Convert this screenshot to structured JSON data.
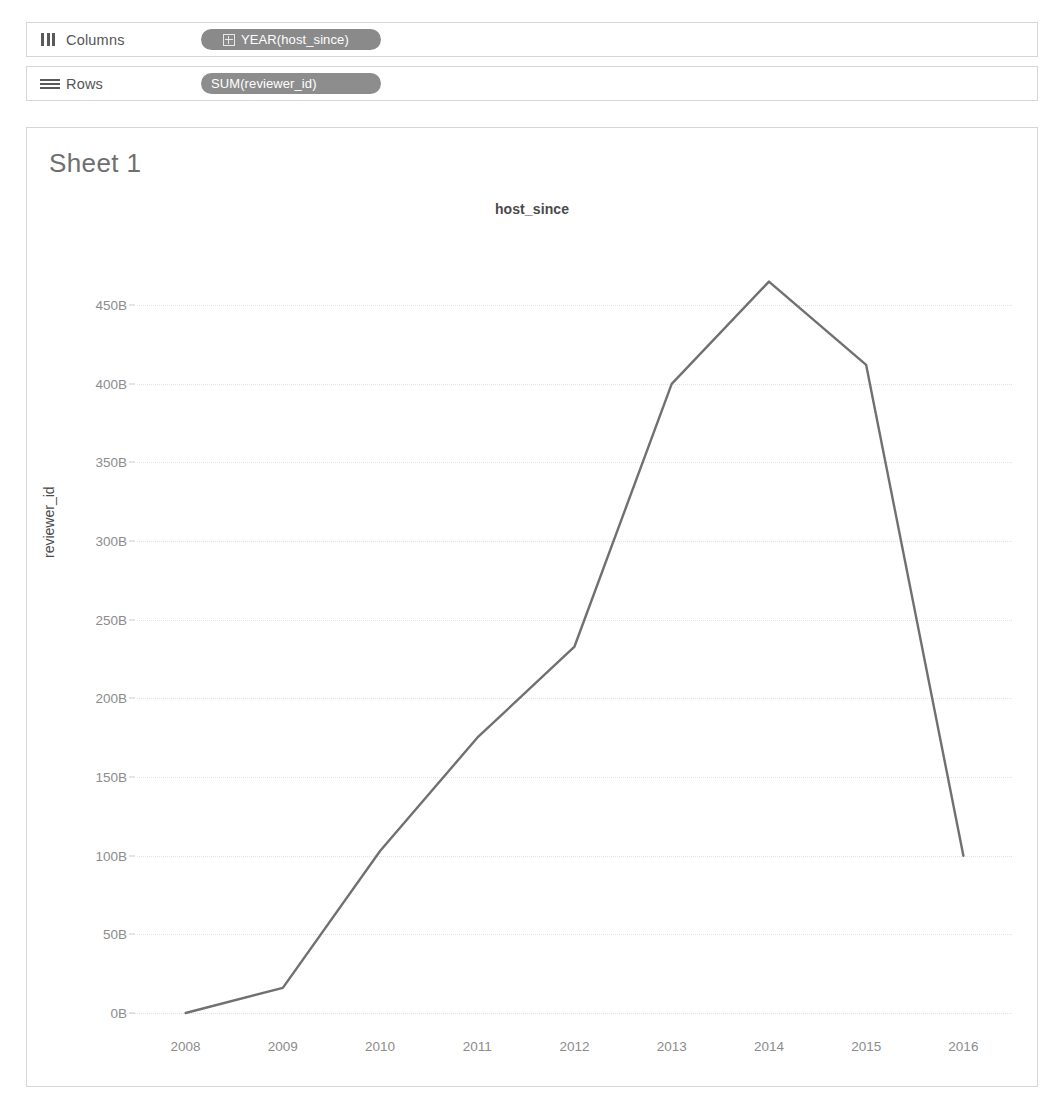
{
  "shelves": [
    {
      "name": "columns",
      "icon": "columns-icon",
      "label": "Columns",
      "pill": {
        "text": "YEAR(host_since)",
        "has_expand": true,
        "color": "#8d8d8d"
      }
    },
    {
      "name": "rows",
      "icon": "rows-icon",
      "label": "Rows",
      "pill": {
        "text": "SUM(reviewer_id)",
        "has_expand": false,
        "color": "#8a8a8a"
      }
    }
  ],
  "view": {
    "sheet_title": "Sheet 1"
  },
  "chart_data": {
    "type": "line",
    "title": "host_since",
    "xlabel": "",
    "ylabel": "reviewer_id",
    "x": [
      2008,
      2009,
      2010,
      2011,
      2012,
      2013,
      2014,
      2015,
      2016
    ],
    "xtick_labels": [
      "2008",
      "2009",
      "2010",
      "2011",
      "2012",
      "2013",
      "2014",
      "2015",
      "2016"
    ],
    "values": [
      0,
      16,
      103,
      175,
      233,
      400,
      465,
      412,
      100
    ],
    "yticks": [
      0,
      50,
      100,
      150,
      200,
      250,
      300,
      350,
      400,
      450
    ],
    "ytick_labels": [
      "0B",
      "50B",
      "100B",
      "150B",
      "200B",
      "250B",
      "300B",
      "350B",
      "400B",
      "450B"
    ],
    "ylim": [
      0,
      480
    ],
    "units": "B",
    "grid": true,
    "legend": "none",
    "line_color": "#707070",
    "line_width": 2.4
  }
}
